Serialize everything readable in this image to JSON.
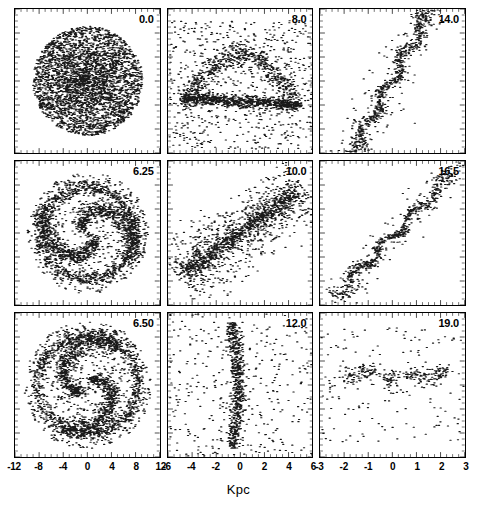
{
  "figure": {
    "xlabel": "Kpc"
  },
  "chart_data": {
    "type": "scatter",
    "title": "",
    "subtitle": "",
    "xlabel": "Kpc",
    "ylabel": "",
    "grid": false,
    "legend": "none",
    "layout": {
      "rows": 3,
      "cols": 3,
      "shared_xlabel": "Kpc",
      "tick_direction": "in",
      "marker_color": "#1a1a1a",
      "marker_size_px": 1.2,
      "frame_color": "#000000"
    },
    "column_axes": [
      {
        "column": 0,
        "xlim": [
          -12,
          12
        ],
        "ylim": [
          -12,
          12
        ],
        "xticks": [
          -12,
          -8,
          -4,
          0,
          4,
          8,
          12
        ],
        "xticklabels": [
          "-12",
          "-8",
          "-4",
          "0",
          "4",
          "8",
          "12"
        ],
        "minor_ticks_per_interval": 3
      },
      {
        "column": 1,
        "xlim": [
          -6,
          6
        ],
        "ylim": [
          -6,
          6
        ],
        "xticks": [
          -6,
          -4,
          -2,
          0,
          2,
          4,
          6
        ],
        "xticklabels": [
          "-6",
          "-4",
          "-2",
          "0",
          "2",
          "4",
          "6"
        ],
        "minor_ticks_per_interval": 3
      },
      {
        "column": 2,
        "xlim": [
          -3,
          3
        ],
        "ylim": [
          -3,
          3
        ],
        "xticks": [
          -3,
          -2,
          -1,
          0,
          1,
          2,
          3
        ],
        "xticklabels": [
          "-3",
          "-2",
          "-1",
          "0",
          "1",
          "2",
          "3"
        ],
        "minor_ticks_per_interval": 3
      }
    ],
    "panels": [
      {
        "index": 0,
        "row": 0,
        "col": 0,
        "label": "0.0",
        "n_points": 3400,
        "morphology": "uniform spheroidal cloud",
        "xlim": [
          -12,
          12
        ],
        "ylim": [
          -12,
          12
        ]
      },
      {
        "index": 1,
        "row": 0,
        "col": 1,
        "label": "8.0",
        "n_points": 2100,
        "morphology": "horizontal dense filament with diffuse arc halo",
        "xlim": [
          -6,
          6
        ],
        "ylim": [
          -6,
          6
        ]
      },
      {
        "index": 2,
        "row": 0,
        "col": 2,
        "label": "14.0",
        "n_points": 900,
        "morphology": "steep diagonal filament, lower-left to upper-right",
        "xlim": [
          -3,
          3
        ],
        "ylim": [
          -3,
          3
        ]
      },
      {
        "index": 3,
        "row": 1,
        "col": 0,
        "label": "6.25",
        "n_points": 2600,
        "morphology": "two-armed spiral with outer ring",
        "xlim": [
          -12,
          12
        ],
        "ylim": [
          -12,
          12
        ]
      },
      {
        "index": 4,
        "row": 1,
        "col": 1,
        "label": "10.0",
        "n_points": 1600,
        "morphology": "inclined elongated bar with scattered halo",
        "xlim": [
          -6,
          6
        ],
        "ylim": [
          -6,
          6
        ]
      },
      {
        "index": 5,
        "row": 1,
        "col": 2,
        "label": "16.5",
        "n_points": 700,
        "morphology": "thin diagonal filament",
        "xlim": [
          -3,
          3
        ],
        "ylim": [
          -3,
          3
        ]
      },
      {
        "index": 6,
        "row": 2,
        "col": 0,
        "label": "6.50",
        "n_points": 2700,
        "morphology": "two-armed spiral with prominent outer ring",
        "xlim": [
          -12,
          12
        ],
        "ylim": [
          -12,
          12
        ]
      },
      {
        "index": 7,
        "row": 2,
        "col": 1,
        "label": "12.0",
        "n_points": 1000,
        "morphology": "near-vertical narrow filament",
        "xlim": [
          -6,
          6
        ],
        "ylim": [
          -6,
          6
        ]
      },
      {
        "index": 8,
        "row": 2,
        "col": 2,
        "label": "19.0",
        "n_points": 420,
        "morphology": "broken horizontal clumpy chain",
        "xlim": [
          -3,
          3
        ],
        "ylim": [
          -3,
          3
        ]
      }
    ]
  }
}
